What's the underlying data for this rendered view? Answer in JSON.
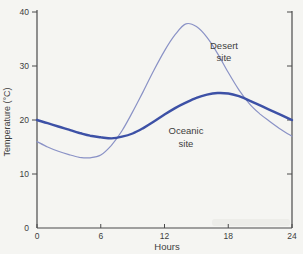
{
  "figure": {
    "background": "#f5f5f2",
    "smudge_color": "#e6e6e1",
    "axis_color": "#4a4a4a",
    "text_color": "#3d3d3d"
  },
  "chart_data": {
    "type": "line",
    "title": "",
    "xlabel": "Hours",
    "ylabel": "Temperature (°C)",
    "xlim": [
      0,
      24
    ],
    "ylim": [
      0,
      40
    ],
    "xticks": [
      0,
      6,
      12,
      18,
      24
    ],
    "yticks": [
      0,
      10,
      20,
      30,
      40
    ],
    "right_axis_ticks": [
      10,
      20,
      30,
      40
    ],
    "grid": false,
    "legend_position": "inline-annotations",
    "x": [
      0,
      1,
      2,
      3,
      4,
      5,
      6,
      7,
      8,
      9,
      10,
      11,
      12,
      13,
      14,
      15,
      16,
      17,
      18,
      19,
      20,
      21,
      22,
      23,
      24
    ],
    "series": [
      {
        "name": "Desert site",
        "color": "#8a92c6",
        "stroke_width": 1.2,
        "values": [
          16.0,
          15.0,
          14.2,
          13.6,
          13.1,
          13.0,
          13.5,
          15.3,
          18.0,
          21.5,
          25.3,
          29.2,
          32.8,
          35.8,
          37.8,
          37.3,
          35.3,
          32.3,
          28.8,
          25.6,
          23.0,
          21.1,
          19.6,
          18.2,
          17.0
        ]
      },
      {
        "name": "Oceanic site",
        "color": "#3d51a6",
        "stroke_width": 2.4,
        "values": [
          20.0,
          19.4,
          18.8,
          18.2,
          17.6,
          17.1,
          16.8,
          16.6,
          16.9,
          17.5,
          18.5,
          19.7,
          21.0,
          22.2,
          23.2,
          24.1,
          24.7,
          25.0,
          24.9,
          24.4,
          23.6,
          22.7,
          21.8,
          20.9,
          20.0
        ]
      }
    ],
    "annotations": [
      {
        "name": "desert-site-label",
        "lines": [
          "Desert",
          "site"
        ],
        "x_px": 224,
        "y_px": 49,
        "line_height": 12
      },
      {
        "name": "oceanic-site-label",
        "lines": [
          "Oceanic",
          "site"
        ],
        "x_px": 186,
        "y_px": 134,
        "line_height": 13
      }
    ]
  }
}
